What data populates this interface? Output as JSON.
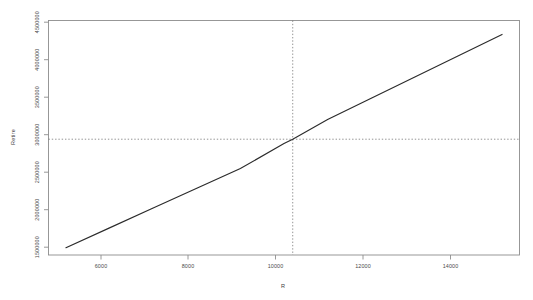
{
  "chart_data": {
    "type": "line",
    "title": "",
    "xlabel": "R",
    "ylabel": "Retire",
    "xlim": [
      4600,
      15400
    ],
    "ylim": [
      1420000,
      4620000
    ],
    "grid": false,
    "legend": null,
    "x_ticks": [
      6000,
      8000,
      10000,
      12000,
      14000
    ],
    "x_tick_labels": [
      "6000",
      "8000",
      "10000",
      "12000",
      "14000"
    ],
    "y_ticks": [
      1500000,
      2000000,
      2500000,
      3000000,
      3500000,
      4000000,
      4500000
    ],
    "y_tick_labels": [
      "1500000",
      "2000000",
      "2500000",
      "3000000",
      "3500000",
      "4000000",
      "4500000"
    ],
    "series": [
      {
        "name": "Retire",
        "style": "solid",
        "color": "#2b2b2b",
        "x": [
          5000,
          6000,
          7000,
          8000,
          9000,
          10000,
          10200,
          11000,
          12000,
          13000,
          14000,
          15000
        ],
        "values": [
          1520000,
          1790000,
          2060000,
          2330000,
          2600000,
          2940000,
          3000000,
          3270000,
          3560000,
          3850000,
          4140000,
          4430000
        ]
      }
    ],
    "reference_lines": [
      {
        "name": "horizontal-reference",
        "orientation": "horizontal",
        "value": 3000000,
        "style": "dotted",
        "color": "#777777"
      },
      {
        "name": "vertical-reference",
        "orientation": "vertical",
        "value": 10200,
        "style": "dotted",
        "color": "#777777"
      }
    ],
    "intersection": {
      "x": 10200,
      "y": 3000000
    }
  },
  "axes": {
    "x_title": "R",
    "y_title": "Retire"
  }
}
